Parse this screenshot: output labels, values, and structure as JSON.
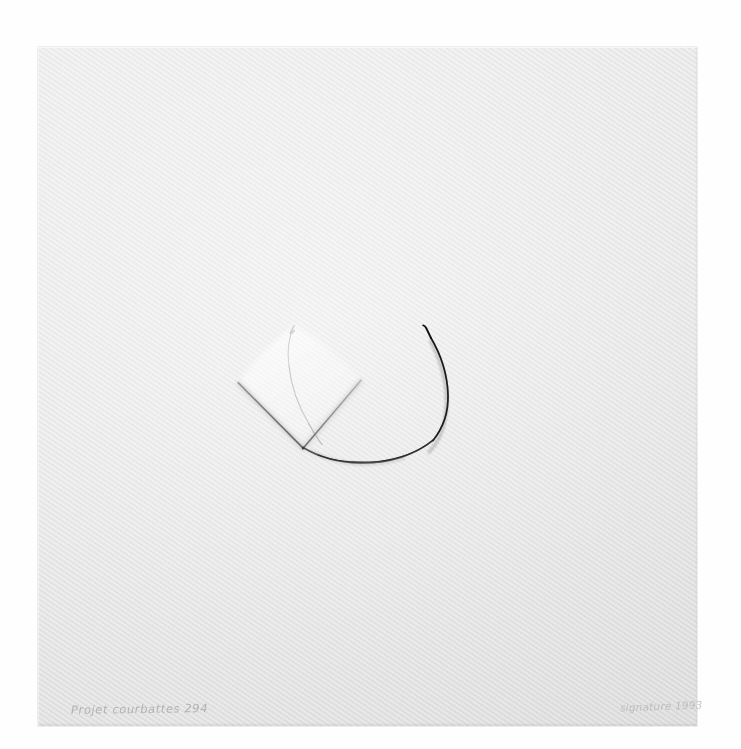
{
  "artwork": {
    "medium_note": "pencil and embossed relief on textured wove paper",
    "title_inscription": "Projet courbattes 294",
    "signature_inscription": "signature  1993",
    "paper": {
      "color": "#e4e4e4",
      "background_color": "#fefefe",
      "left": 38,
      "top": 47,
      "width": 659,
      "height": 679
    },
    "marks": [
      {
        "name": "arc",
        "type": "circular-arc",
        "center_x": 370,
        "center_y": 395,
        "radius": 77,
        "start_angle_deg": 248,
        "end_angle_deg": 65,
        "stroke_dark": "#1b1b1b",
        "stroke_light": "#d2d2d2",
        "description": "open circle, graphite dark at upper right fading to almost invisible at upper left"
      },
      {
        "name": "v-line-left",
        "type": "straight-line",
        "x1": 238,
        "y1": 383,
        "x2": 303,
        "y2": 448,
        "stroke": "#8b8b8b"
      },
      {
        "name": "v-line-right",
        "type": "straight-line",
        "x1": 303,
        "y1": 448,
        "x2": 361,
        "y2": 380,
        "stroke": "#9a9a9a"
      },
      {
        "name": "embossed-quadrilateral",
        "type": "relief-panel",
        "description": "lozenge of raised paper bounded by the two V lines and the arc"
      }
    ]
  }
}
